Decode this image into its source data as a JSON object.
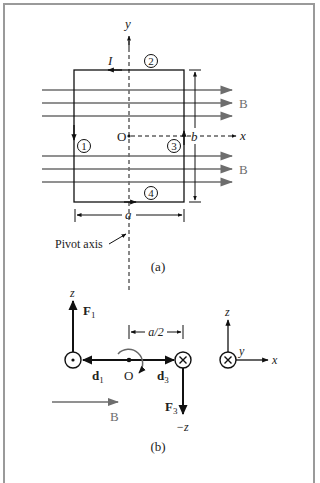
{
  "figure_a": {
    "caption": "(a)",
    "axes": {
      "y_label": "y",
      "x_label": "x",
      "origin_label": "O"
    },
    "current_label": "I",
    "segments": [
      "1",
      "2",
      "3",
      "4"
    ],
    "field_label_upper": "B",
    "field_label_lower": "B",
    "dimension_width": "a",
    "dimension_height": "b",
    "pivot_label": "Pivot axis"
  },
  "figure_b": {
    "caption": "(b)",
    "force1": {
      "label": "F",
      "sub": "1"
    },
    "force3": {
      "label": "F",
      "sub": "3"
    },
    "d1": {
      "label": "d",
      "sub": "1"
    },
    "d3": {
      "label": "d",
      "sub": "3"
    },
    "origin_label": "O",
    "half_width_label": "a/2",
    "z_label": "z",
    "neg_z_label": "−z",
    "field_label": "B",
    "legend_axes": {
      "z": "z",
      "y": "y",
      "x": "x"
    }
  },
  "colors": {
    "line": "#111111",
    "field": "#6d6d6d",
    "frame": "#9a9a9a"
  }
}
